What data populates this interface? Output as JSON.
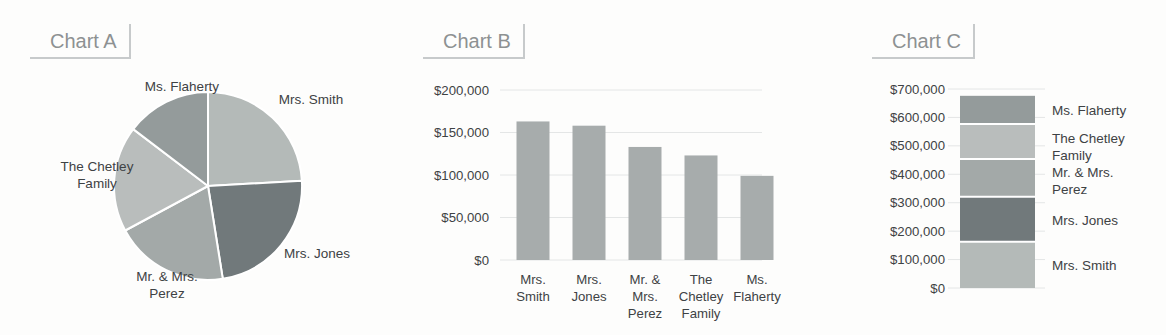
{
  "figure": {
    "background": "#fdfdfc",
    "grid_color": "#e4e6e6",
    "axis_text_color": "#3e4244",
    "title_text_color": "#8d9192",
    "title_border_color": "#c7cacb",
    "slice_border_color": "#ffffff"
  },
  "chart_data": [
    {
      "id": "chart-a",
      "type": "pie",
      "title": "Chart A",
      "direction": "clockwise",
      "start_angle_deg": 0,
      "total": 676000,
      "slices": [
        {
          "label": "Mrs. Smith",
          "label_lines": [
            "Mrs. Smith"
          ],
          "value": 163000,
          "color": "#b4bab8"
        },
        {
          "label": "Mrs. Jones",
          "label_lines": [
            "Mrs. Jones"
          ],
          "value": 158000,
          "color": "#71797b"
        },
        {
          "label": "Mr. & Mrs. Perez",
          "label_lines": [
            "Mr. & Mrs.",
            "Perez"
          ],
          "value": 133000,
          "color": "#a3a9a8"
        },
        {
          "label": "The Chetley Family",
          "label_lines": [
            "The Chetley",
            "Family"
          ],
          "value": 123000,
          "color": "#b9bdbc"
        },
        {
          "label": "Ms. Flaherty",
          "label_lines": [
            "Ms. Flaherty"
          ],
          "value": 99000,
          "color": "#949b9b"
        }
      ]
    },
    {
      "id": "chart-b",
      "type": "bar",
      "title": "Chart B",
      "ylim": [
        0,
        200000
      ],
      "ytick_step": 50000,
      "grid": true,
      "bar_color": "#a7acac",
      "yticks": [
        {
          "value": 0,
          "label": "$0"
        },
        {
          "value": 50000,
          "label": "$50,000"
        },
        {
          "value": 100000,
          "label": "$100,000"
        },
        {
          "value": 150000,
          "label": "$150,000"
        },
        {
          "value": 200000,
          "label": "$200,000"
        }
      ],
      "categories": [
        {
          "label": "Mrs. Smith",
          "label_lines": [
            "Mrs.",
            "Smith"
          ],
          "value": 163000
        },
        {
          "label": "Mrs. Jones",
          "label_lines": [
            "Mrs.",
            "Jones"
          ],
          "value": 158000
        },
        {
          "label": "Mr. & Mrs. Perez",
          "label_lines": [
            "Mr. &",
            "Mrs.",
            "Perez"
          ],
          "value": 133000
        },
        {
          "label": "The Chetley Family",
          "label_lines": [
            "The",
            "Chetley",
            "Family"
          ],
          "value": 123000
        },
        {
          "label": "Ms. Flaherty",
          "label_lines": [
            "Ms.",
            "Flaherty"
          ],
          "value": 99000
        }
      ]
    },
    {
      "id": "chart-c",
      "type": "stacked-bar",
      "title": "Chart C",
      "ylim": [
        0,
        700000
      ],
      "ytick_step": 100000,
      "grid": true,
      "total": 676000,
      "yticks": [
        {
          "value": 0,
          "label": "$0"
        },
        {
          "value": 100000,
          "label": "$100,000"
        },
        {
          "value": 200000,
          "label": "$200,000"
        },
        {
          "value": 300000,
          "label": "$300,000"
        },
        {
          "value": 400000,
          "label": "$400,000"
        },
        {
          "value": 500000,
          "label": "$500,000"
        },
        {
          "value": 600000,
          "label": "$600,000"
        },
        {
          "value": 700000,
          "label": "$700,000"
        }
      ],
      "segments_bottom_to_top": [
        {
          "label": "Mrs. Smith",
          "label_lines": [
            "Mrs. Smith"
          ],
          "value": 163000,
          "color": "#b4bab8"
        },
        {
          "label": "Mrs. Jones",
          "label_lines": [
            "Mrs. Jones"
          ],
          "value": 158000,
          "color": "#71797b"
        },
        {
          "label": "Mr. & Mrs. Perez",
          "label_lines": [
            "Mr. & Mrs.",
            "Perez"
          ],
          "value": 133000,
          "color": "#a3a9a8"
        },
        {
          "label": "The Chetley Family",
          "label_lines": [
            "The Chetley",
            "Family"
          ],
          "value": 123000,
          "color": "#b9bdbc"
        },
        {
          "label": "Ms. Flaherty",
          "label_lines": [
            "Ms. Flaherty"
          ],
          "value": 99000,
          "color": "#949b9b"
        }
      ]
    }
  ]
}
